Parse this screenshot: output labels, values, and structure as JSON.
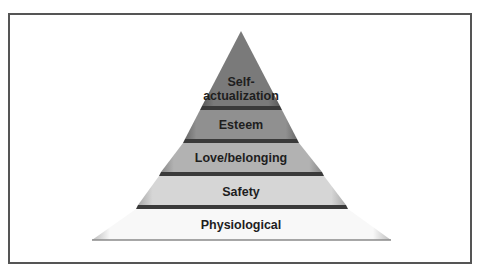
{
  "diagram": {
    "type": "pyramid",
    "levels": [
      {
        "label_line1": "Self-",
        "label_line2": "actualization",
        "color": "#7a7a7a"
      },
      {
        "label": "Esteem",
        "color": "#8e8e8e"
      },
      {
        "label": "Love/belonging",
        "color": "#b0b0b0"
      },
      {
        "label": "Safety",
        "color": "#d2d2d2"
      },
      {
        "label": "Physiological",
        "color": "#f6f6f6"
      }
    ],
    "separator_color": "#3a3a3a",
    "frame_color": "#555555"
  }
}
